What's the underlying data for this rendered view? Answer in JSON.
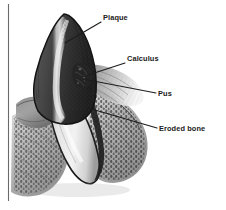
{
  "figure": {
    "kind": "anatomical-illustration",
    "background_color": "#ffffff",
    "ink_color": "#1a1a1a",
    "frame_rule_color": "#6a6a6a"
  },
  "callouts": [
    {
      "id": "plaque",
      "label": "Plaque",
      "text_x": 103,
      "text_y": 20,
      "leader_from_x": 101,
      "leader_from_y": 22,
      "leader_to_x": 65,
      "leader_to_y": 43
    },
    {
      "id": "calculus",
      "label": "Calculus",
      "text_x": 127,
      "text_y": 61,
      "leader_from_x": 125,
      "leader_from_y": 63,
      "leader_to_x": 82,
      "leader_to_y": 77
    },
    {
      "id": "pus",
      "label": "Pus",
      "text_x": 158,
      "text_y": 96,
      "leader_from_x": 156,
      "leader_from_y": 93,
      "leader_to_x": 83,
      "leader_to_y": 79
    },
    {
      "id": "eroded-bone",
      "label": "Eroded bone",
      "text_x": 159,
      "text_y": 131,
      "leader_from_x": 157,
      "leader_from_y": 128,
      "leader_to_x": 88,
      "leader_to_y": 108
    }
  ],
  "frame": {
    "left_rule_x": 8,
    "left_rule_top": 4,
    "left_rule_bottom": 201
  }
}
